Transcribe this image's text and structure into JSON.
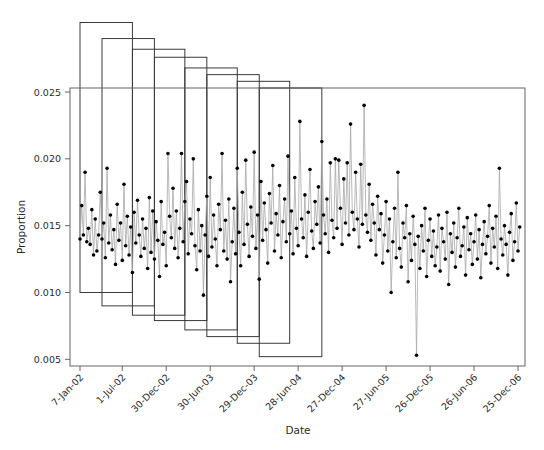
{
  "chart_data": {
    "type": "line",
    "title": "",
    "xlabel": "Date",
    "ylabel": "Proportion",
    "grid": false,
    "legend": "none",
    "ylim": [
      0.0045,
      0.0253
    ],
    "yticks": [
      0.005,
      0.01,
      0.015,
      0.02,
      0.025
    ],
    "ytick_labels": [
      "0.005",
      "0.010",
      "0.015",
      "0.020",
      "0.025"
    ],
    "xtick_labels": [
      "7-Jan-02",
      "1-Jul-02",
      "30-Dec-02",
      "30-Jun-03",
      "29-Dec-03",
      "28-Jun-04",
      "27-Dec-04",
      "27-Jun-05",
      "26-Dec-05",
      "26-Jun-06",
      "25-Dec-06"
    ],
    "xtick_index": [
      0,
      25,
      51,
      77,
      103,
      129,
      155,
      181,
      207,
      233,
      259
    ],
    "n_points": 261,
    "series": [
      {
        "name": "Proportion",
        "values": [
          0.014,
          0.0165,
          0.0143,
          0.019,
          0.0138,
          0.0148,
          0.0136,
          0.0162,
          0.0128,
          0.0155,
          0.0131,
          0.0143,
          0.0175,
          0.014,
          0.0152,
          0.0126,
          0.0193,
          0.0137,
          0.0158,
          0.0132,
          0.0147,
          0.0121,
          0.0166,
          0.0139,
          0.0152,
          0.0124,
          0.0181,
          0.0135,
          0.0157,
          0.0128,
          0.0149,
          0.0115,
          0.016,
          0.0137,
          0.0169,
          0.0143,
          0.0127,
          0.0155,
          0.0133,
          0.0148,
          0.0118,
          0.0171,
          0.013,
          0.0161,
          0.0125,
          0.0153,
          0.0139,
          0.0112,
          0.0168,
          0.0136,
          0.0145,
          0.012,
          0.0204,
          0.0157,
          0.0141,
          0.0178,
          0.0133,
          0.0161,
          0.0126,
          0.0148,
          0.0204,
          0.0138,
          0.0168,
          0.0183,
          0.0129,
          0.0155,
          0.0144,
          0.02,
          0.0135,
          0.0117,
          0.0162,
          0.0131,
          0.015,
          0.0098,
          0.0143,
          0.0172,
          0.0127,
          0.0186,
          0.0134,
          0.0158,
          0.014,
          0.012,
          0.0166,
          0.0147,
          0.0204,
          0.0131,
          0.0154,
          0.0125,
          0.017,
          0.0108,
          0.0138,
          0.0163,
          0.0129,
          0.0193,
          0.0145,
          0.012,
          0.0175,
          0.0136,
          0.0199,
          0.0151,
          0.0127,
          0.0164,
          0.0142,
          0.0205,
          0.0133,
          0.0158,
          0.011,
          0.0183,
          0.0139,
          0.0167,
          0.0147,
          0.0122,
          0.0174,
          0.0152,
          0.0195,
          0.0131,
          0.0159,
          0.0143,
          0.018,
          0.0126,
          0.0153,
          0.017,
          0.0138,
          0.0202,
          0.0144,
          0.0161,
          0.0129,
          0.0186,
          0.0148,
          0.0135,
          0.0228,
          0.0155,
          0.0141,
          0.0173,
          0.0127,
          0.016,
          0.0192,
          0.0146,
          0.0133,
          0.0168,
          0.0151,
          0.0179,
          0.0137,
          0.0213,
          0.0158,
          0.0144,
          0.017,
          0.013,
          0.0197,
          0.0154,
          0.0141,
          0.02,
          0.0148,
          0.0199,
          0.0163,
          0.0136,
          0.0185,
          0.0152,
          0.0197,
          0.0143,
          0.0226,
          0.016,
          0.0147,
          0.019,
          0.0155,
          0.0134,
          0.0196,
          0.0151,
          0.024,
          0.0158,
          0.0145,
          0.0181,
          0.0139,
          0.0166,
          0.0152,
          0.0128,
          0.0172,
          0.0147,
          0.0159,
          0.0122,
          0.0143,
          0.0168,
          0.0131,
          0.0155,
          0.01,
          0.0138,
          0.0163,
          0.0126,
          0.019,
          0.0133,
          0.0119,
          0.0152,
          0.0141,
          0.0165,
          0.0108,
          0.0144,
          0.0124,
          0.0157,
          0.0136,
          0.0053,
          0.0142,
          0.0118,
          0.015,
          0.0131,
          0.0163,
          0.0112,
          0.0139,
          0.0155,
          0.0127,
          0.0146,
          0.012,
          0.0134,
          0.0158,
          0.0116,
          0.0148,
          0.0138,
          0.0125,
          0.016,
          0.0106,
          0.0144,
          0.013,
          0.0152,
          0.0119,
          0.0141,
          0.0163,
          0.0127,
          0.0135,
          0.0149,
          0.0113,
          0.0156,
          0.0132,
          0.0144,
          0.0121,
          0.0138,
          0.0158,
          0.0125,
          0.0147,
          0.0111,
          0.0136,
          0.0153,
          0.0129,
          0.0142,
          0.0165,
          0.0122,
          0.0148,
          0.0134,
          0.0157,
          0.0118,
          0.0193,
          0.014,
          0.0128,
          0.015,
          0.0136,
          0.0113,
          0.0145,
          0.0159,
          0.0124,
          0.0138,
          0.0167,
          0.0131,
          0.0149
        ]
      }
    ],
    "step_rects": [
      {
        "x_start": 0,
        "x_end": 31,
        "y_top": 0.0302,
        "y_bottom": 0.01
      },
      {
        "x_start": 13,
        "x_end": 44,
        "y_top": 0.029,
        "y_bottom": 0.009
      },
      {
        "x_start": 31,
        "x_end": 62,
        "y_top": 0.0282,
        "y_bottom": 0.0083
      },
      {
        "x_start": 44,
        "x_end": 75,
        "y_top": 0.0276,
        "y_bottom": 0.0079
      },
      {
        "x_start": 62,
        "x_end": 93,
        "y_top": 0.0268,
        "y_bottom": 0.0072
      },
      {
        "x_start": 75,
        "x_end": 106,
        "y_top": 0.0263,
        "y_bottom": 0.0067
      },
      {
        "x_start": 93,
        "x_end": 124,
        "y_top": 0.0258,
        "y_bottom": 0.0062
      },
      {
        "x_start": 106,
        "x_end": 143,
        "y_top": 0.0253,
        "y_bottom": 0.0052
      }
    ]
  },
  "axes": {
    "y_title": "Proportion",
    "x_title": "Date"
  }
}
